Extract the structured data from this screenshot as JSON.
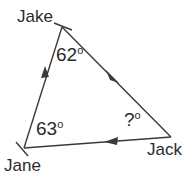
{
  "figure": {
    "type": "triangle-diagram",
    "background_color": "#ffffff",
    "stroke_color": "#3a3a3a",
    "text_color": "#2b2b2b",
    "vertices": [
      {
        "name": "Jake",
        "label": "Jake",
        "x": 62,
        "y": 27
      },
      {
        "name": "Jane",
        "label": "Jane",
        "x": 24,
        "y": 148
      },
      {
        "name": "Jack",
        "label": "Jack",
        "x": 171,
        "y": 137
      }
    ],
    "edges": [
      {
        "from": "Jane",
        "to": "Jake",
        "direction": "up-right"
      },
      {
        "from": "Jake",
        "to": "Jack",
        "direction": "down-right"
      },
      {
        "from": "Jack",
        "to": "Jane",
        "direction": "left"
      }
    ],
    "angles": [
      {
        "at": "Jake",
        "value": "62",
        "degree_symbol": "o",
        "text": "62o"
      },
      {
        "at": "Jane",
        "value": "63",
        "degree_symbol": "o",
        "text": "63o"
      },
      {
        "at": "Jack",
        "value": "?",
        "degree_symbol": "o",
        "text": "?o"
      }
    ]
  },
  "labels": {
    "jake": "Jake",
    "jane": "Jane",
    "jack": "Jack",
    "angle_jake": "62",
    "angle_jane": "63",
    "angle_jack": "?",
    "degree": "o"
  }
}
